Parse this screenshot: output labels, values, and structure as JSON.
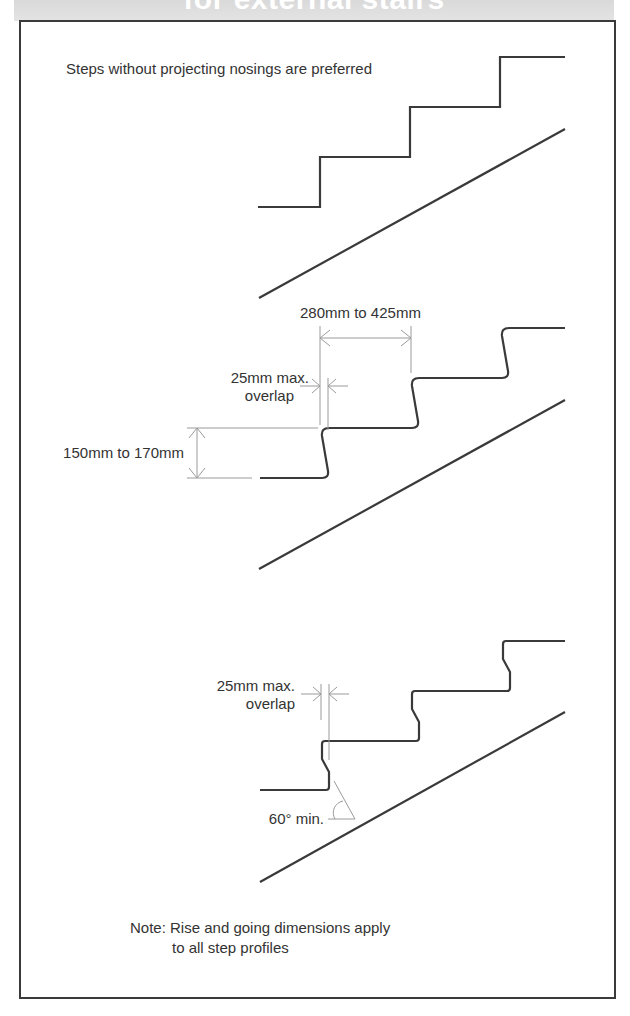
{
  "header": {
    "title": "for external stairs"
  },
  "intro_text": "Steps without projecting nosings are preferred",
  "profile_square": {
    "name": "Square nosing profile"
  },
  "profile_rounded": {
    "going_label": "280mm to 425mm",
    "overlap_label_line1": "25mm max.",
    "overlap_label_line2": "overlap",
    "rise_label": "150mm to 170mm"
  },
  "profile_chamfered": {
    "overlap_label_line1": "25mm max.",
    "overlap_label_line2": "overlap",
    "angle_label": "60° min."
  },
  "note": {
    "line1": "Note: Rise and going dimensions apply",
    "line2": "to all step profiles"
  },
  "colors": {
    "stroke_main": "#3a3a3a",
    "stroke_dim": "#9a9a9a",
    "text": "#333333",
    "header_band": "#dedede"
  }
}
